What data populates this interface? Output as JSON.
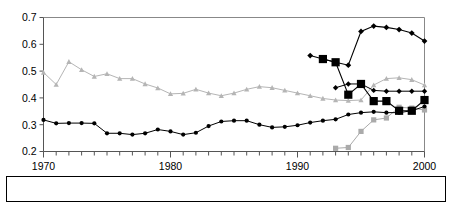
{
  "chart_data": {
    "type": "line",
    "title": "",
    "subtitle": "",
    "xlabel": "",
    "ylabel": "",
    "xlim": [
      1970,
      2000
    ],
    "ylim": [
      0.2,
      0.7
    ],
    "ytick_labels": [
      "0.2",
      "0.3",
      "0.4",
      "0.5",
      "0.6",
      "0.7"
    ],
    "ytick_values": [
      0.2,
      0.3,
      0.4,
      0.5,
      0.6,
      0.7
    ],
    "xtick_labels": [
      "1970",
      "1980",
      "1990",
      "2000"
    ],
    "xtick_values": [
      1970,
      1980,
      1990,
      2000
    ],
    "xtick_minor_step": 1,
    "grid": false,
    "legend_position": "bottom",
    "plot_border": true,
    "series": [
      {
        "name": "Czech Republic",
        "color": "#000000",
        "marker": "diamond",
        "x": [
          1991,
          1992,
          1993,
          1994,
          1995,
          1996,
          1997,
          1998,
          1999,
          2000
        ],
        "values": [
          0.558,
          0.545,
          0.533,
          0.522,
          0.648,
          0.668,
          0.663,
          0.655,
          0.642,
          0.612
        ]
      },
      {
        "name": "Hungary",
        "color": "#aaaaaa",
        "marker": "square",
        "x": [
          1993,
          1994,
          1995,
          1996,
          1997,
          1998,
          1999,
          2000
        ],
        "values": [
          0.212,
          0.215,
          0.275,
          0.318,
          0.325,
          0.365,
          0.362,
          0.355
        ]
      },
      {
        "name": "Korea",
        "color": "#b5b5b5",
        "marker": "triangle",
        "x": [
          1970,
          1971,
          1972,
          1973,
          1974,
          1975,
          1976,
          1977,
          1978,
          1979,
          1980,
          1981,
          1982,
          1983,
          1984,
          1985,
          1986,
          1987,
          1988,
          1989,
          1990,
          1991,
          1992,
          1993,
          1994,
          1995,
          1996,
          1997,
          1998,
          1999,
          2000
        ],
        "values": [
          0.495,
          0.45,
          0.535,
          0.505,
          0.48,
          0.49,
          0.472,
          0.472,
          0.452,
          0.437,
          0.415,
          0.417,
          0.432,
          0.418,
          0.408,
          0.418,
          0.432,
          0.442,
          0.438,
          0.428,
          0.418,
          0.408,
          0.398,
          0.392,
          0.39,
          0.392,
          0.448,
          0.472,
          0.475,
          0.468,
          0.448
        ]
      },
      {
        "name": "Mexico",
        "color": "#000000",
        "marker": "diamond-small",
        "x": [
          1993,
          1994,
          1995,
          1996,
          1997,
          1998,
          1999,
          2000
        ],
        "values": [
          0.438,
          0.452,
          0.452,
          0.428,
          0.425,
          0.425,
          0.425,
          0.425
        ]
      },
      {
        "name": "Poland",
        "color": "#000000",
        "marker": "square-large",
        "x": [
          1992,
          1993,
          1994,
          1995,
          1996,
          1997,
          1998,
          1999,
          2000
        ],
        "values": [
          0.545,
          0.533,
          0.412,
          0.452,
          0.388,
          0.388,
          0.352,
          0.352,
          0.392
        ]
      },
      {
        "name": "Old OECD",
        "color": "#000000",
        "marker": "dot",
        "x": [
          1970,
          1971,
          1972,
          1973,
          1974,
          1975,
          1976,
          1977,
          1978,
          1979,
          1980,
          1981,
          1982,
          1983,
          1984,
          1985,
          1986,
          1987,
          1988,
          1989,
          1990,
          1991,
          1992,
          1993,
          1994,
          1995,
          1996,
          1997,
          1998,
          1999,
          2000
        ],
        "values": [
          0.318,
          0.305,
          0.306,
          0.306,
          0.305,
          0.268,
          0.268,
          0.263,
          0.268,
          0.282,
          0.275,
          0.263,
          0.27,
          0.295,
          0.312,
          0.315,
          0.315,
          0.3,
          0.29,
          0.292,
          0.298,
          0.308,
          0.315,
          0.32,
          0.338,
          0.345,
          0.348,
          0.345,
          0.345,
          0.352,
          0.368
        ]
      }
    ]
  },
  "legend": {
    "entries": [
      {
        "label": "Czech Republic",
        "marker": "diamond",
        "color": "#000000"
      },
      {
        "label": "Hungary",
        "marker": "square",
        "color": "#aaaaaa"
      },
      {
        "label": "Korea",
        "marker": "triangle",
        "color": "#b5b5b5"
      },
      {
        "label": "Mexico",
        "marker": "diamond-small",
        "color": "#000000"
      },
      {
        "label": "Poland",
        "marker": "square-large",
        "color": "#000000"
      },
      {
        "label": "Old OECD",
        "marker": "dot",
        "color": "#000000"
      }
    ]
  }
}
